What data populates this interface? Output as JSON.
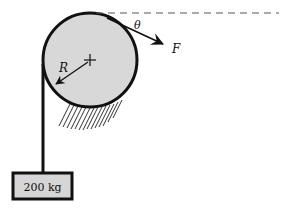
{
  "figure": {
    "width": 282,
    "height": 214,
    "background_color": "#ffffff"
  },
  "colors": {
    "stroke": "#111111",
    "cylinder_fill": "#d8d8d8",
    "block_fill": "#d6d6d6",
    "hatch": "#333333",
    "dashed_line": "#555555"
  },
  "labels": {
    "radius": "R",
    "angle": "θ",
    "force": "F",
    "mass_block": "200 kg"
  },
  "geometry": {
    "cylinder": {
      "cx": 90,
      "cy": 60,
      "r": 47,
      "stroke_width": 3
    },
    "center_mark": {
      "x": 90,
      "y": 60,
      "size": 6
    },
    "radius_arrow": {
      "from_x": 88,
      "from_y": 62,
      "to_x": 54,
      "to_y": 86
    },
    "cord": {
      "x": 43,
      "y_top": 64,
      "y_bottom": 174,
      "stroke_width": 3
    },
    "block": {
      "x": 13,
      "y": 173,
      "width": 59,
      "height": 26,
      "stroke_width": 3
    },
    "dashed_line": {
      "x1": 96,
      "y1": 13,
      "x2": 278,
      "y2": 13
    },
    "force_arrow": {
      "from_x": 106,
      "from_y": 17,
      "to_x": 168,
      "to_y": 46
    },
    "hatch": {
      "x_start": 66,
      "x_end": 124,
      "y_top": 104,
      "y_bottom": 130,
      "count": 14
    }
  },
  "label_positions": {
    "radius": {
      "x": 59,
      "y": 71
    },
    "angle": {
      "x": 134,
      "y": 29
    },
    "force": {
      "x": 172,
      "y": 52
    },
    "mass_block": {
      "x": 42,
      "y": 191
    }
  }
}
